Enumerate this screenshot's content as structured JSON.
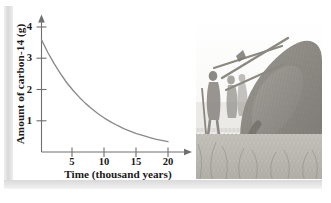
{
  "figure": {
    "name": "carbon-14-decay-figure"
  },
  "chart_data": {
    "type": "line",
    "title": "",
    "subtitle": "",
    "xlabel": "Time (thousand years)",
    "ylabel": "Amount of carbon-14 (g)",
    "xlim": [
      0,
      22
    ],
    "ylim": [
      0,
      4.3
    ],
    "xticks": [
      5,
      10,
      15,
      20
    ],
    "xtick_labels": [
      "5",
      "10",
      "15",
      "20"
    ],
    "yticks": [
      1,
      2,
      3,
      4
    ],
    "ytick_labels": [
      "1",
      "2",
      "3",
      "4"
    ],
    "grid": false,
    "legend": null,
    "axis_arrows": true,
    "series": [
      {
        "name": "carbon-14 remaining",
        "color": "#8a8a8a",
        "x": [
          0,
          1,
          2,
          3,
          4,
          5,
          6,
          7,
          8,
          9,
          10,
          11,
          12,
          13,
          14,
          15,
          16,
          17,
          18,
          19,
          20
        ],
        "y": [
          3.6,
          3.19,
          2.83,
          2.51,
          2.22,
          1.97,
          1.75,
          1.55,
          1.38,
          1.22,
          1.08,
          0.96,
          0.85,
          0.75,
          0.67,
          0.59,
          0.53,
          0.47,
          0.41,
          0.37,
          0.33
        ]
      }
    ],
    "annotations": []
  },
  "illustration": {
    "name": "mammoth-hunt-illustration",
    "description": "Pencil sketch of prehistoric hunters with spears attacking a woolly mammoth in tall grass",
    "elements": [
      "woolly-mammoth",
      "hunter-figures",
      "spears",
      "tusk",
      "grass"
    ],
    "palette": {
      "mammoth_dark": "#8e8b85",
      "mammoth_mid": "#a8a59f",
      "grass": "#bdbab3",
      "tusk": "#f2f0ea",
      "sky": "#ffffff"
    }
  },
  "frame": {
    "name": "figure-border",
    "color": "#dcdcdc"
  }
}
